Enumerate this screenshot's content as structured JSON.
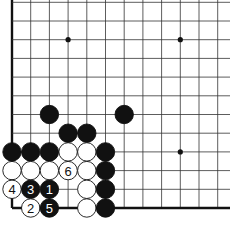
{
  "diagram": {
    "type": "go-board-corner",
    "corner": "bottom-left",
    "grid": {
      "origin_x": 12,
      "bottom_y": 208,
      "spacing": 18.7,
      "columns": 12,
      "rows": 12,
      "line_color": "#333333",
      "edge_color": "#111111"
    },
    "star_points": [
      {
        "col": 3,
        "row": 9
      },
      {
        "col": 9,
        "row": 9
      },
      {
        "col": 9,
        "row": 3
      }
    ],
    "stones": [
      {
        "color": "black",
        "col": 2,
        "row": 5,
        "label": ""
      },
      {
        "color": "black",
        "col": 6,
        "row": 5,
        "label": ""
      },
      {
        "color": "black",
        "col": 3,
        "row": 4,
        "label": ""
      },
      {
        "color": "black",
        "col": 4,
        "row": 4,
        "label": ""
      },
      {
        "color": "black",
        "col": 0,
        "row": 3,
        "label": ""
      },
      {
        "color": "black",
        "col": 1,
        "row": 3,
        "label": ""
      },
      {
        "color": "black",
        "col": 2,
        "row": 3,
        "label": ""
      },
      {
        "color": "white",
        "col": 3,
        "row": 3,
        "label": ""
      },
      {
        "color": "white",
        "col": 4,
        "row": 3,
        "label": ""
      },
      {
        "color": "black",
        "col": 5,
        "row": 3,
        "label": ""
      },
      {
        "color": "white",
        "col": 0,
        "row": 2,
        "label": ""
      },
      {
        "color": "white",
        "col": 1,
        "row": 2,
        "label": ""
      },
      {
        "color": "white",
        "col": 2,
        "row": 2,
        "label": ""
      },
      {
        "color": "white",
        "col": 3,
        "row": 2,
        "label": "6"
      },
      {
        "color": "white",
        "col": 4,
        "row": 2,
        "label": ""
      },
      {
        "color": "black",
        "col": 5,
        "row": 2,
        "label": ""
      },
      {
        "color": "white",
        "col": 0,
        "row": 1,
        "label": "4"
      },
      {
        "color": "black",
        "col": 1,
        "row": 1,
        "label": "3"
      },
      {
        "color": "black",
        "col": 2,
        "row": 1,
        "label": "1"
      },
      {
        "color": "white",
        "col": 4,
        "row": 1,
        "label": ""
      },
      {
        "color": "black",
        "col": 5,
        "row": 1,
        "label": ""
      },
      {
        "color": "white",
        "col": 1,
        "row": 0,
        "label": "2"
      },
      {
        "color": "black",
        "col": 2,
        "row": 0,
        "label": "5"
      },
      {
        "color": "white",
        "col": 4,
        "row": 0,
        "label": ""
      },
      {
        "color": "black",
        "col": 5,
        "row": 0,
        "label": ""
      }
    ],
    "move_sequence": [
      "1",
      "2",
      "3",
      "4",
      "5",
      "6"
    ]
  }
}
